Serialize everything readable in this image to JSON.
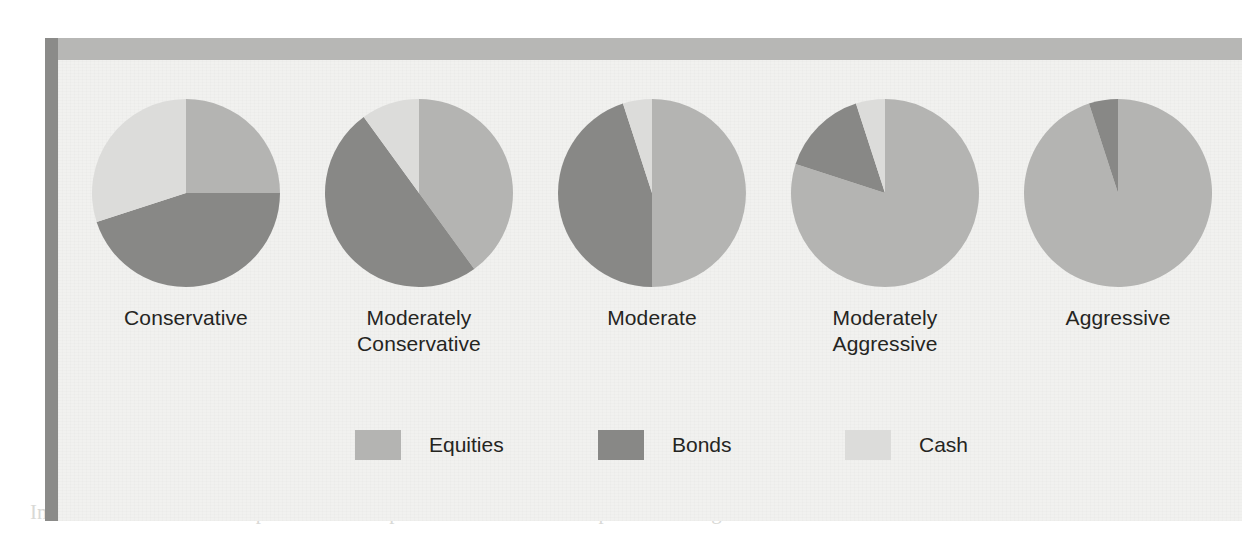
{
  "figure": {
    "panel_background": "#f1f1ef",
    "left_rule_color": "#8b8b89",
    "top_band_color": "#b7b7b5"
  },
  "colors": {
    "equities": "#b4b4b2",
    "bonds": "#888886",
    "cash": "#dcdcda",
    "label_text": "#25251f"
  },
  "legend": {
    "position": "bottom-center",
    "items": [
      {
        "label": "Equities",
        "color": "#b4b4b2",
        "swatch_name": "equities-swatch"
      },
      {
        "label": "Bonds",
        "color": "#888886",
        "swatch_name": "bonds-swatch"
      },
      {
        "label": "Cash",
        "color": "#dcdcda",
        "swatch_name": "cash-swatch"
      }
    ]
  },
  "chart_data": {
    "type": "pie",
    "title": "",
    "subtitle": "",
    "xlabel": "",
    "ylabel": "",
    "grid": false,
    "legend_position": "bottom",
    "units": "percent",
    "slice_names": [
      "Equities",
      "Bonds",
      "Cash"
    ],
    "slice_colors": [
      "#b4b4b2",
      "#888886",
      "#dcdcda"
    ],
    "charts": [
      {
        "label": "Conservative",
        "label_lines": [
          "Conservative"
        ],
        "categories": [
          "Equities",
          "Bonds",
          "Cash"
        ],
        "values": [
          25,
          45,
          30
        ]
      },
      {
        "label": "Moderately Conservative",
        "label_lines": [
          "Moderately",
          "Conservative"
        ],
        "categories": [
          "Equities",
          "Bonds",
          "Cash"
        ],
        "values": [
          40,
          50,
          10
        ]
      },
      {
        "label": "Moderate",
        "label_lines": [
          "Moderate"
        ],
        "categories": [
          "Equities",
          "Bonds",
          "Cash"
        ],
        "values": [
          50,
          45,
          5
        ]
      },
      {
        "label": "Moderately Aggressive",
        "label_lines": [
          "Moderately",
          "Aggressive"
        ],
        "categories": [
          "Equities",
          "Bonds",
          "Cash"
        ],
        "values": [
          80,
          15,
          5
        ]
      },
      {
        "label": "Aggressive",
        "label_lines": [
          "Aggressive"
        ],
        "categories": [
          "Equities",
          "Bonds",
          "Cash"
        ],
        "values": [
          95,
          5,
          0
        ]
      }
    ]
  },
  "background_page": {
    "note": "faint show-through text from the scanned book page",
    "ghost_texts": [
      {
        "text": "Stocks",
        "x": 905,
        "y": 300,
        "size": 20,
        "bold": true
      },
      {
        "text": "$100,000",
        "x": 1005,
        "y": 300,
        "size": 20,
        "bold": false
      },
      {
        "text": "$130,000",
        "x": 470,
        "y": 300,
        "size": 19,
        "bold": false
      },
      {
        "text": "30%",
        "x": 690,
        "y": 300,
        "size": 19,
        "bold": false
      },
      {
        "text": "Bonds",
        "x": 905,
        "y": 352,
        "size": 20,
        "bold": true
      },
      {
        "text": "100,000",
        "x": 455,
        "y": 352,
        "size": 19,
        "bold": false
      },
      {
        "text": "50%",
        "x": 690,
        "y": 352,
        "size": 19,
        "bold": false
      },
      {
        "text": "$152,500",
        "x": 1000,
        "y": 352,
        "size": 19,
        "bold": false
      },
      {
        "text": "In the ratio we like to take positions in the portfolio that are here in place in a long run fashion",
        "x": 30,
        "y": 500,
        "size": 21,
        "bold": false
      }
    ]
  }
}
